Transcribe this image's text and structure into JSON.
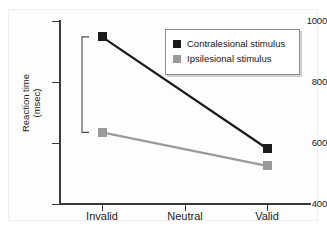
{
  "chart_data": {
    "type": "line",
    "title": "",
    "xlabel": "",
    "ylabel": "Reaction time",
    "ylabel_units": "(msec)",
    "categories": [
      "Invalid",
      "Neutral",
      "Valid"
    ],
    "ylim": [
      400,
      1000
    ],
    "yticks": [
      400,
      600,
      800,
      1000
    ],
    "ytick_labels": [
      "400",
      "600",
      "800",
      "1000"
    ],
    "grid": false,
    "legend_position": "top-right",
    "series": [
      {
        "name": "Contralesional stimulus",
        "color": "#1a1a1a",
        "marker": "square",
        "x": [
          "Invalid",
          "Valid"
        ],
        "values": [
          948,
          582
        ]
      },
      {
        "name": "Ipsilesional stimulus",
        "color": "#9a9a9a",
        "marker": "square",
        "x": [
          "Invalid",
          "Valid"
        ],
        "values": [
          635,
          525
        ]
      }
    ],
    "annotations": [
      {
        "name": "difference-bracket",
        "type": "bracket",
        "at_category": "Invalid",
        "from_value": 948,
        "to_value": 635,
        "label": ""
      }
    ]
  },
  "axes": {
    "y_tick_labels": [
      "1000",
      "800",
      "600",
      "400"
    ],
    "y_title_line1": "Reaction time",
    "y_title_line2": "(msec)",
    "x_tick_labels": [
      "Invalid",
      "Neutral",
      "Valid"
    ]
  },
  "legend": {
    "items": [
      {
        "label": "Contralesional stimulus",
        "color": "#1a1a1a"
      },
      {
        "label": "Ipsilesional stimulus",
        "color": "#9a9a9a"
      }
    ]
  }
}
